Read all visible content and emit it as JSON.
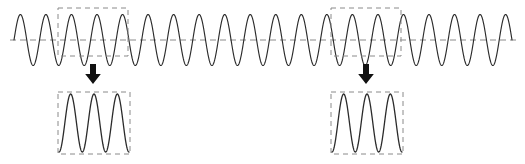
{
  "figure": {
    "background_color": "#ffffff",
    "width": 525,
    "height": 164
  },
  "chart_data": {
    "type": "line",
    "title": "",
    "xlabel": "",
    "ylabel": "",
    "grid": false,
    "legend": null,
    "series": [
      {
        "name": "carrier-waveform",
        "waveform": "sine",
        "cycles": 19.5,
        "amplitude": 1.0,
        "phase_deg": 0,
        "x_start_px": 14,
        "x_end_px": 512,
        "baseline_y_px": 40,
        "peak_y_px": 11,
        "trough_y_px": 62,
        "color": "#2b2b2b"
      }
    ],
    "reference_line": {
      "name": "midline",
      "value": 0,
      "orientation": "horizontal",
      "style": "dashed",
      "color": "#8a8a8a",
      "x_start_px": 10,
      "x_end_px": 516,
      "y_px": 40
    },
    "annotations": [
      {
        "name": "selection-box-left",
        "kind": "dashed-rectangle",
        "x_px": 58,
        "y_px": 8,
        "width_px": 70,
        "height_px": 48,
        "cycles_covered": 3,
        "color": "#8a8a8a"
      },
      {
        "name": "selection-box-right",
        "kind": "dashed-rectangle",
        "x_px": 331,
        "y_px": 8,
        "width_px": 70,
        "height_px": 48,
        "cycles_covered": 3,
        "color": "#8a8a8a"
      },
      {
        "name": "magnify-arrow-left",
        "kind": "down-arrow",
        "x_px": 93,
        "y_px": 64,
        "height_px": 20,
        "color": "#111111"
      },
      {
        "name": "magnify-arrow-right",
        "kind": "down-arrow",
        "x_px": 366,
        "y_px": 64,
        "height_px": 20,
        "color": "#111111"
      }
    ],
    "insets": [
      {
        "name": "magnified-view-left",
        "source": "selection-box-left",
        "x_px": 58,
        "y_px": 92,
        "width_px": 72,
        "height_px": 62,
        "cycles": 3,
        "waveform": "sine",
        "amplitude": 1.0,
        "color": "#2b2b2b"
      },
      {
        "name": "magnified-view-right",
        "source": "selection-box-right",
        "x_px": 331,
        "y_px": 92,
        "width_px": 72,
        "height_px": 62,
        "cycles": 3,
        "waveform": "sine",
        "amplitude": 1.0,
        "color": "#2b2b2b"
      }
    ]
  },
  "colors": {
    "wave_stroke": "#2b2b2b",
    "dashed_gray": "#8a8a8a",
    "arrow_black": "#111111",
    "background": "#ffffff"
  }
}
